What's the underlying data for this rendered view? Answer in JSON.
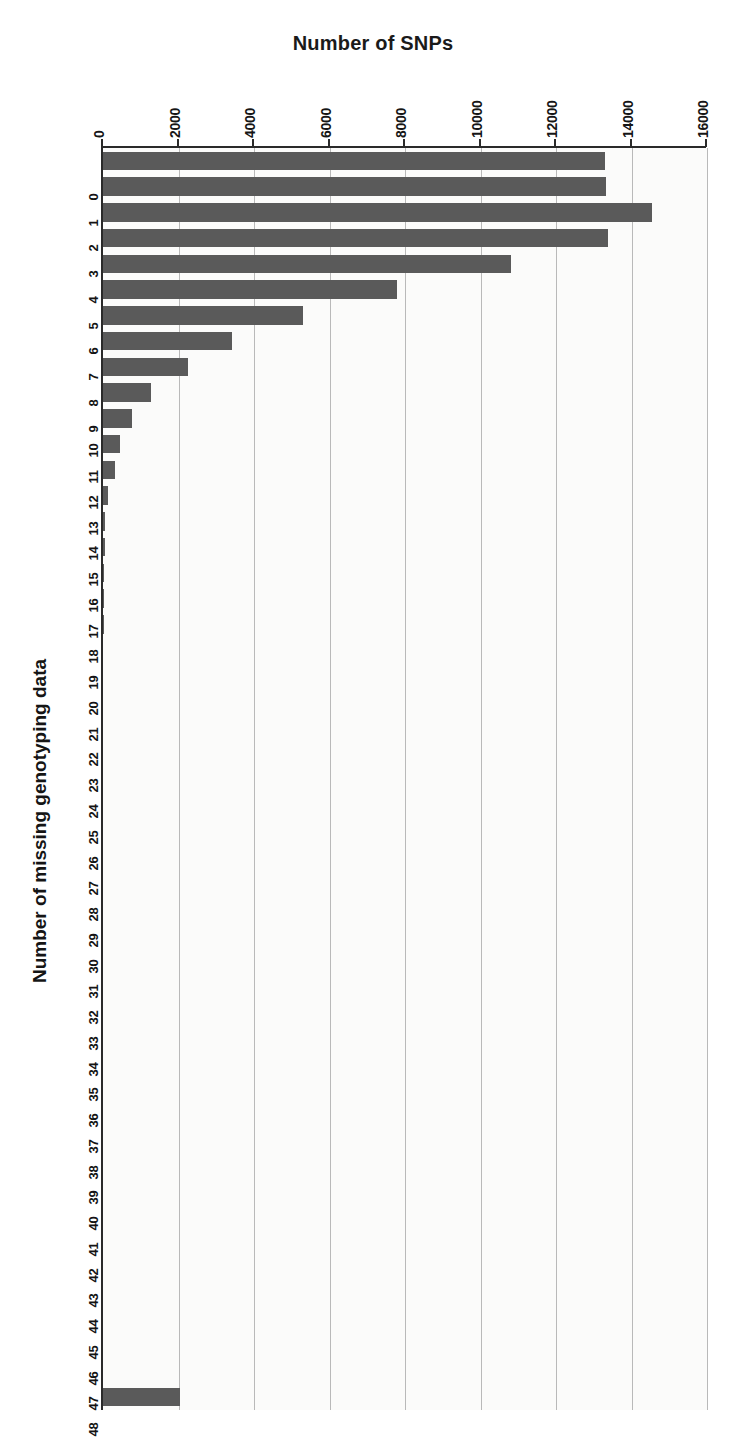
{
  "chart_data": {
    "type": "bar",
    "orientation": "horizontal",
    "title": "Number of SNPs",
    "xlabel": "Number of missing genotyping data",
    "ylabel": "Number of SNPs",
    "grid": true,
    "legend": null,
    "value_axis": {
      "position": "top",
      "min": 0,
      "max": 16000,
      "tick_step": 2000,
      "tick_labels": [
        "0",
        "2000",
        "4000",
        "6000",
        "8000",
        "10000",
        "12000",
        "14000",
        "16000"
      ],
      "tick_values": [
        0,
        2000,
        4000,
        6000,
        8000,
        10000,
        12000,
        14000,
        16000
      ]
    },
    "category_axis": {
      "position": "left",
      "label": "Number of missing genotyping data"
    },
    "categories": [
      "0",
      "1",
      "2",
      "3",
      "4",
      "5",
      "6",
      "7",
      "8",
      "9",
      "10",
      "11",
      "12",
      "13",
      "14",
      "15",
      "16",
      "17",
      "18",
      "19",
      "20",
      "21",
      "22",
      "23",
      "24",
      "25",
      "26",
      "27",
      "28",
      "29",
      "30",
      "31",
      "32",
      "33",
      "34",
      "35",
      "36",
      "37",
      "38",
      "39",
      "40",
      "41",
      "42",
      "43",
      "44",
      "45",
      "46",
      "47",
      "48"
    ],
    "values": [
      13300,
      13330,
      14550,
      13370,
      10800,
      7780,
      5310,
      3430,
      2260,
      1280,
      780,
      460,
      330,
      120,
      60,
      40,
      25,
      18,
      12,
      0,
      0,
      0,
      0,
      0,
      0,
      0,
      0,
      0,
      0,
      0,
      0,
      0,
      0,
      0,
      0,
      0,
      0,
      0,
      0,
      0,
      0,
      0,
      0,
      0,
      0,
      0,
      0,
      0,
      2040
    ],
    "bar_color": "#5a5a5a",
    "plot_background": "#fbfbfa",
    "axis_color": "#2a2a2a",
    "gridline_color": "#b9b9b9"
  }
}
